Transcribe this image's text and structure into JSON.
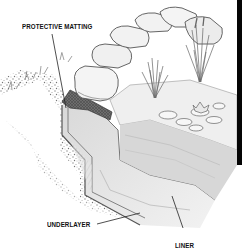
{
  "diagram": {
    "labels": {
      "protective_matting": "PROTECTIVE MATTING",
      "underlayer": "UNDERLAYER",
      "liner": "LINER"
    },
    "elements": [
      {
        "name": "coping-stones",
        "description": "row of rounded edging stones along top of bank"
      },
      {
        "name": "protective-matting",
        "description": "dark textured mat under the front stone"
      },
      {
        "name": "underlayer",
        "description": "layer beneath liner along stepped trench"
      },
      {
        "name": "liner",
        "description": "sheet lining the stepped pond shelf"
      },
      {
        "name": "gravel-soil",
        "description": "speckled soil/gravel on left bank"
      },
      {
        "name": "reeds",
        "description": "two clumps of reed grass on shelf"
      },
      {
        "name": "water-lilies",
        "description": "lily pads and flower on pond surface"
      }
    ]
  },
  "colors": {
    "ink": "#111111",
    "paper": "#ffffff",
    "pencil_dark": "#555555",
    "pencil_mid": "#8a8a8a",
    "pencil_light": "#c8c8c8",
    "edge_bar": "#050505"
  }
}
